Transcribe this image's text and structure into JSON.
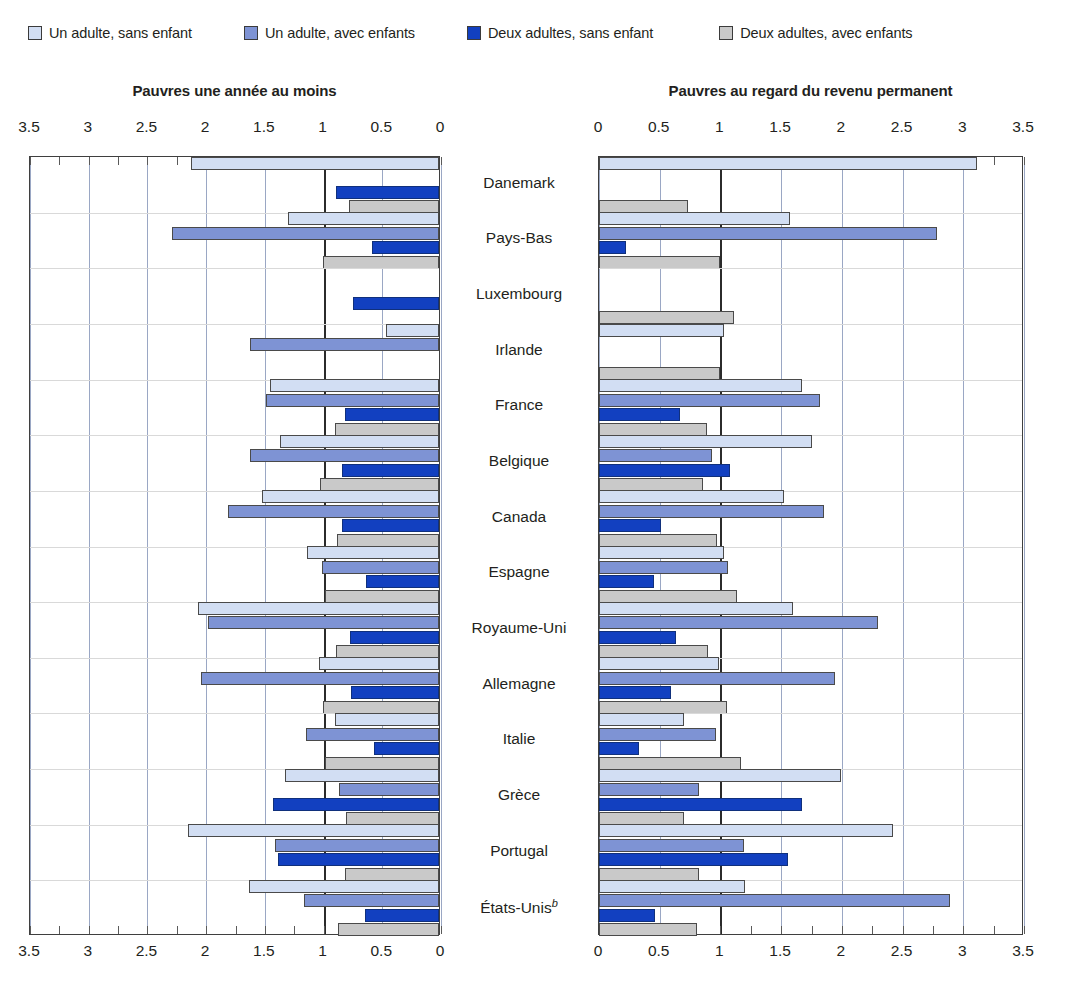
{
  "legend": {
    "items": [
      {
        "label": "Un adulte, sans enfant",
        "color": "#d2def3",
        "key": "one-adult-no-child"
      },
      {
        "label": "Un adulte, avec enfants",
        "color": "#7e93d4",
        "key": "one-adult-with-children"
      },
      {
        "label": "Deux adultes, sans enfant",
        "color": "#1240c0",
        "key": "two-adults-no-child"
      },
      {
        "label": "Deux adultes, avec enfants",
        "color": "#c9c9c9",
        "key": "two-adults-with-children"
      }
    ]
  },
  "panels": {
    "left": {
      "title": "Pauvres une année au moins"
    },
    "right": {
      "title": "Pauvres au regard du revenu permanent"
    }
  },
  "axis": {
    "left_ticks": [
      "3.5",
      "3",
      "2.5",
      "2",
      "1.5",
      "1",
      "0.5",
      "0"
    ],
    "right_ticks": [
      "0",
      "0.5",
      "1",
      "1.5",
      "2",
      "2.5",
      "3",
      "3.5"
    ]
  },
  "countries": [
    {
      "name": "Danemark",
      "footnote": ""
    },
    {
      "name": "Pays-Bas",
      "footnote": ""
    },
    {
      "name": "Luxembourg",
      "footnote": ""
    },
    {
      "name": "Irlande",
      "footnote": ""
    },
    {
      "name": "France",
      "footnote": ""
    },
    {
      "name": "Belgique",
      "footnote": ""
    },
    {
      "name": "Canada",
      "footnote": ""
    },
    {
      "name": "Espagne",
      "footnote": ""
    },
    {
      "name": "Royaume-Uni",
      "footnote": ""
    },
    {
      "name": "Allemagne",
      "footnote": ""
    },
    {
      "name": "Italie",
      "footnote": ""
    },
    {
      "name": "Grèce",
      "footnote": ""
    },
    {
      "name": "Portugal",
      "footnote": ""
    },
    {
      "name": "États-Unis",
      "footnote": "b"
    }
  ],
  "chart_data": [
    {
      "id": "left",
      "type": "bar",
      "orientation": "horizontal",
      "direction": "right-to-left",
      "title": "Pauvres une année au moins",
      "xlabel": "",
      "ylabel": "",
      "xlim": [
        0,
        3.5
      ],
      "xticks": [
        0,
        0.5,
        1,
        1.5,
        2,
        2.5,
        3,
        3.5
      ],
      "grid": true,
      "reference_line": 1,
      "legend_position": "top",
      "categories": [
        "Danemark",
        "Pays-Bas",
        "Luxembourg",
        "Irlande",
        "France",
        "Belgique",
        "Canada",
        "Espagne",
        "Royaume-Uni",
        "Allemagne",
        "Italie",
        "Grèce",
        "Portugal",
        "États-Unis"
      ],
      "series": [
        {
          "name": "Un adulte, sans enfant",
          "values": [
            2.11,
            1.29,
            0.0,
            0.45,
            1.44,
            1.35,
            1.51,
            1.12,
            2.05,
            1.02,
            0.89,
            1.31,
            2.14,
            1.62
          ]
        },
        {
          "name": "Un adulte, avec enfants",
          "values": [
            0.0,
            2.27,
            0.0,
            1.61,
            1.47,
            1.61,
            1.8,
            1.0,
            1.97,
            2.03,
            1.13,
            0.85,
            1.4,
            1.15
          ]
        },
        {
          "name": "Deux adultes, sans enfant",
          "values": [
            0.88,
            0.57,
            0.73,
            0.0,
            0.8,
            0.83,
            0.83,
            0.62,
            0.76,
            0.75,
            0.55,
            1.41,
            1.37,
            0.63
          ]
        },
        {
          "name": "Deux adultes, avec enfants",
          "values": [
            0.77,
            0.99,
            0.0,
            0.0,
            0.89,
            1.01,
            0.87,
            0.97,
            0.88,
            0.99,
            0.97,
            0.79,
            0.8,
            0.86
          ]
        }
      ]
    },
    {
      "id": "right",
      "type": "bar",
      "orientation": "horizontal",
      "direction": "left-to-right",
      "title": "Pauvres au regard du revenu permanent",
      "xlabel": "",
      "ylabel": "",
      "xlim": [
        0,
        3.5
      ],
      "xticks": [
        0,
        0.5,
        1,
        1.5,
        2,
        2.5,
        3,
        3.5
      ],
      "grid": true,
      "reference_line": 1,
      "legend_position": "top",
      "categories": [
        "Danemark",
        "Pays-Bas",
        "Luxembourg",
        "Irlande",
        "France",
        "Belgique",
        "Canada",
        "Espagne",
        "Royaume-Uni",
        "Allemagne",
        "Italie",
        "Grèce",
        "Portugal",
        "États-Unis"
      ],
      "series": [
        {
          "name": "Un adulte, sans enfant",
          "values": [
            3.11,
            1.57,
            0.0,
            1.03,
            1.67,
            1.75,
            1.52,
            1.03,
            1.6,
            0.99,
            0.7,
            1.99,
            2.42,
            1.2
          ]
        },
        {
          "name": "Un adulte, avec enfants",
          "values": [
            0.0,
            2.78,
            0.0,
            0.0,
            1.82,
            0.93,
            1.85,
            1.06,
            2.3,
            1.94,
            0.96,
            0.82,
            1.19,
            2.89
          ]
        },
        {
          "name": "Deux adultes, sans enfant",
          "values": [
            0.0,
            0.22,
            0.0,
            0.0,
            0.67,
            1.08,
            0.51,
            0.45,
            0.63,
            0.59,
            0.33,
            1.67,
            1.56,
            0.46
          ]
        },
        {
          "name": "Deux adultes, avec enfants",
          "values": [
            0.73,
            1.0,
            1.11,
            1.0,
            0.89,
            0.86,
            0.97,
            1.14,
            0.9,
            1.05,
            1.17,
            0.7,
            0.82,
            0.81
          ]
        }
      ]
    }
  ]
}
